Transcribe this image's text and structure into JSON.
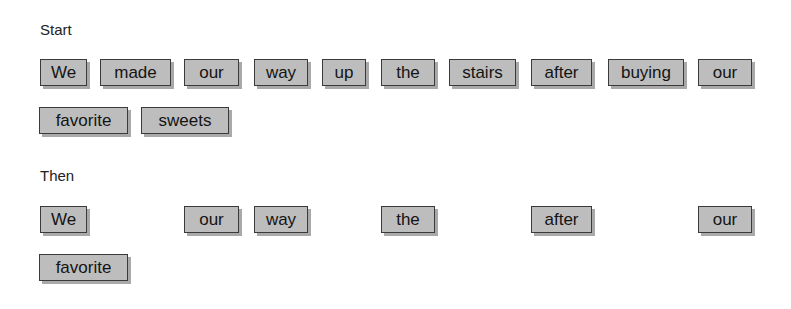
{
  "sections": {
    "start": {
      "label": "Start",
      "rows": [
        [
          {
            "text": "We",
            "x": 40,
            "w": 47
          },
          {
            "text": "made",
            "x": 100,
            "w": 71
          },
          {
            "text": "our",
            "x": 184,
            "w": 55
          },
          {
            "text": "way",
            "x": 254,
            "w": 54
          },
          {
            "text": "up",
            "x": 322,
            "w": 44
          },
          {
            "text": "the",
            "x": 381,
            "w": 54
          },
          {
            "text": "stairs",
            "x": 449,
            "w": 67
          },
          {
            "text": "after",
            "x": 531,
            "w": 61
          },
          {
            "text": "buying",
            "x": 608,
            "w": 76
          },
          {
            "text": "our",
            "x": 698,
            "w": 54
          }
        ],
        [
          {
            "text": "favorite",
            "x": 39,
            "w": 89
          },
          {
            "text": "sweets",
            "x": 141,
            "w": 88
          }
        ]
      ]
    },
    "then": {
      "label": "Then",
      "rows": [
        [
          {
            "text": "We",
            "x": 40,
            "w": 47
          },
          {
            "text": "our",
            "x": 184,
            "w": 55
          },
          {
            "text": "way",
            "x": 254,
            "w": 54
          },
          {
            "text": "the",
            "x": 381,
            "w": 54
          },
          {
            "text": "after",
            "x": 531,
            "w": 61
          },
          {
            "text": "our",
            "x": 698,
            "w": 54
          }
        ],
        [
          {
            "text": "favorite",
            "x": 39,
            "w": 89
          }
        ]
      ]
    }
  },
  "colors": {
    "box_fill": "#bdbdbd",
    "box_border": "#3a3a3a",
    "box_shadow": "#a9a9a9"
  }
}
